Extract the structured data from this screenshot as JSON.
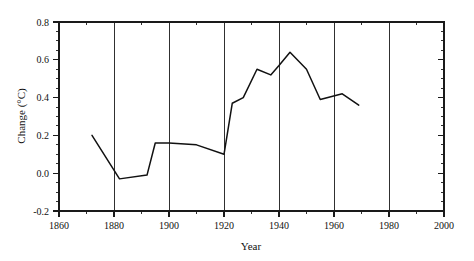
{
  "chart_data": {
    "type": "line",
    "title": "",
    "xlabel": "Year",
    "ylabel": "Change (°C)",
    "xlim": [
      1860,
      2000
    ],
    "ylim": [
      -0.2,
      0.8
    ],
    "xticks": [
      1860,
      1880,
      1900,
      1920,
      1940,
      1960,
      1980,
      2000
    ],
    "xtick_labels": [
      "1860",
      "1880",
      "1900",
      "1920",
      "1940",
      "1960",
      "1980",
      "2000"
    ],
    "yticks": [
      -0.2,
      0.0,
      0.2,
      0.4,
      0.6,
      0.8
    ],
    "ytick_labels": [
      "-0.2",
      "0.0",
      "0.2",
      "0.4",
      "0.6",
      "0.8"
    ],
    "x_minor_tick_interval": 5,
    "y_minor_tick_interval": 0.05,
    "grid": "vertical-major-only",
    "legend": "none",
    "series": [
      {
        "name": "Change (°C)",
        "color": "#111111",
        "x": [
          1872,
          1882,
          1892,
          1895,
          1900,
          1910,
          1920,
          1923,
          1927,
          1932,
          1937,
          1940,
          1944,
          1950,
          1955,
          1963,
          1969
        ],
        "values": [
          0.2,
          -0.03,
          -0.01,
          0.16,
          0.16,
          0.15,
          0.1,
          0.37,
          0.4,
          0.55,
          0.52,
          0.57,
          0.64,
          0.55,
          0.39,
          0.42,
          0.36
        ]
      }
    ]
  },
  "axes": {
    "x_title": "Year",
    "y_title": "Change (°C)"
  }
}
